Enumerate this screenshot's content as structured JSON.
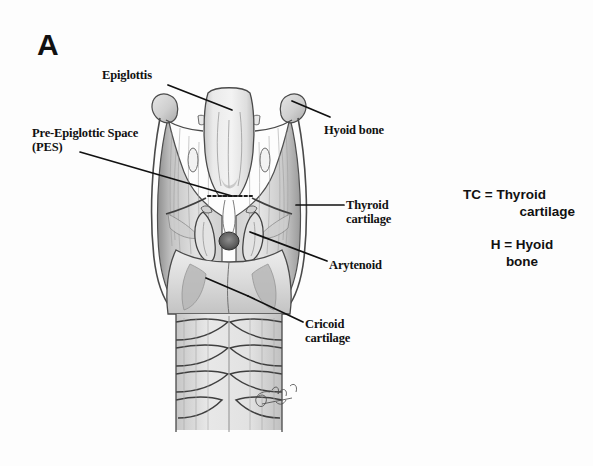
{
  "figure": {
    "panel_letter": "A",
    "background_color": "#fdfdfd",
    "ink_color": "#111111",
    "pencil_light": "#dcdcdc",
    "pencil_mid": "#b4b4b4",
    "pencil_dark": "#6a6a6a",
    "outline_color": "#4a4a4a"
  },
  "labels": {
    "epiglottis": "Epiglottis",
    "pre_epiglottic_space": "Pre-Epiglottic Space\n(PES)",
    "hyoid_bone": "Hyoid bone",
    "thyroid_cartilage": "Thyroid\ncartilage",
    "arytenoid": "Arytenoid",
    "cricoid_cartilage": "Cricoid\ncartilage"
  },
  "legend": {
    "tc_line1": "TC = Thyroid",
    "tc_line2": "cartilage",
    "h_line1": "H = Hyoid",
    "h_line2": "bone"
  },
  "artwork": {
    "subject": "posterior view of human larynx and upper trachea",
    "style": "graphite pencil medical illustration",
    "signature": "artist-signature-cursive-illegible"
  }
}
